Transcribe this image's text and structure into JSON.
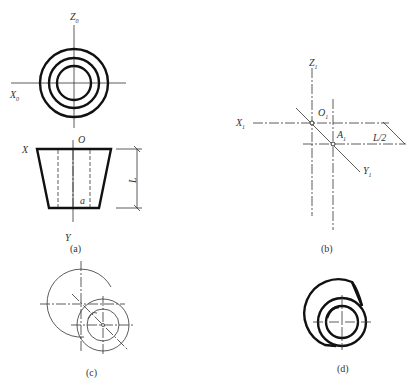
{
  "figure": {
    "panels": [
      {
        "id": "a",
        "caption": "(a)",
        "top_view": {
          "axis_labels": {
            "x": "X",
            "x_sub": "0",
            "z": "Z",
            "z_sub": "0"
          },
          "circles": [
            {
              "cx": 74,
              "cy": 83,
              "r": 34
            },
            {
              "cx": 74,
              "cy": 83,
              "r": 25
            },
            {
              "cx": 74,
              "cy": 83,
              "r": 17
            }
          ]
        },
        "front_view": {
          "labels": {
            "x": "X",
            "origin": "O",
            "y": "Y",
            "point": "a",
            "dimension": "L"
          },
          "shape": "truncated-cone",
          "top_edge": {
            "y": 149,
            "x1": 37,
            "x2": 111
          },
          "bottom_edge": {
            "y": 208,
            "x1": 49,
            "x2": 99
          }
        }
      },
      {
        "id": "b",
        "caption": "(b)",
        "labels": {
          "x": "X",
          "x_sub": "1",
          "z": "Z",
          "z_sub": "1",
          "origin": "O",
          "origin_sub": "1",
          "point": "A",
          "point_sub": "1",
          "y": "Y",
          "y_sub": "1",
          "dimension": "L/2"
        },
        "points": {
          "O1": [
            312,
            123
          ],
          "A1": [
            333,
            144
          ]
        }
      },
      {
        "id": "c",
        "caption": "(c)",
        "large_circle": {
          "cx": 81,
          "cy": 304,
          "r": 34
        },
        "small_circles": [
          {
            "cx": 103,
            "cy": 325,
            "r": 26
          },
          {
            "cx": 103,
            "cy": 325,
            "r": 16
          }
        ]
      },
      {
        "id": "d",
        "caption": "(d)",
        "large_arc": {
          "cx": 322,
          "cy": 302,
          "r": 33
        },
        "small_circles": [
          {
            "cx": 342,
            "cy": 322,
            "r": 24
          },
          {
            "cx": 342,
            "cy": 322,
            "r": 16
          }
        ]
      }
    ]
  }
}
